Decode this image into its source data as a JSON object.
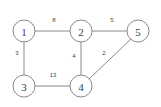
{
  "diagram": {
    "type": "weighted-undirected-graph",
    "background_color": "#ffffff",
    "stroke_color": "#8a8a8a",
    "label_color": "#3d3d3d",
    "nodes": [
      {
        "id": "1",
        "label": "1",
        "cx": 24,
        "cy": 31,
        "r": 11
      },
      {
        "id": "2",
        "label": "2",
        "cx": 81,
        "cy": 31,
        "r": 11
      },
      {
        "id": "3",
        "label": "3",
        "cx": 24,
        "cy": 86,
        "r": 11
      },
      {
        "id": "4",
        "label": "4",
        "cx": 81,
        "cy": 86,
        "r": 11
      },
      {
        "id": "5",
        "label": "5",
        "cx": 138,
        "cy": 31,
        "r": 11
      }
    ],
    "edges": [
      {
        "from": "1",
        "to": "2",
        "weight": "8",
        "x1": 35,
        "y1": 31,
        "x2": 70,
        "y2": 31,
        "lx": 54,
        "ly": 20
      },
      {
        "from": "2",
        "to": "5",
        "weight": "5",
        "x1": 92,
        "y1": 31,
        "x2": 127,
        "y2": 31,
        "lx": 112,
        "ly": 20
      },
      {
        "from": "1",
        "to": "3",
        "weight": "3",
        "x1": 24,
        "y1": 42,
        "x2": 24,
        "y2": 75,
        "lx": 17,
        "ly": 53
      },
      {
        "from": "2",
        "to": "4",
        "weight": "4",
        "x1": 81,
        "y1": 42,
        "x2": 81,
        "y2": 75,
        "lx": 74,
        "ly": 56
      },
      {
        "from": "3",
        "to": "4",
        "weight": "13",
        "x1": 35,
        "y1": 86,
        "x2": 70,
        "y2": 86,
        "lx": 53,
        "ly": 75
      },
      {
        "from": "4",
        "to": "5",
        "weight": "2",
        "x1": 89,
        "y1": 79,
        "x2": 131,
        "y2": 39,
        "lx": 104,
        "ly": 53
      }
    ]
  }
}
